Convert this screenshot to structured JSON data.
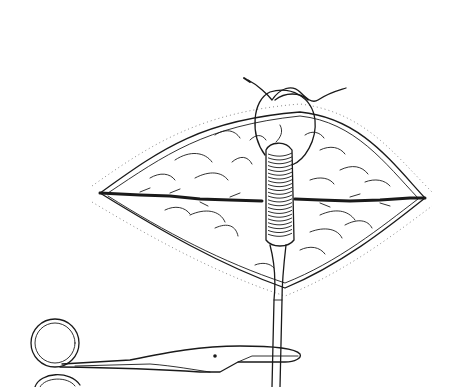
{
  "figure": {
    "kind": "surgical-line-illustration",
    "colors": {
      "ink": "#1a1a1a",
      "paper": "#ffffff",
      "stipple": "#555555"
    },
    "elements": [
      {
        "name": "wound-outline",
        "label": "Lens-shaped wound"
      },
      {
        "name": "incision-line",
        "label": "Incision"
      },
      {
        "name": "gauze-bolster",
        "label": "Rolled bolster"
      },
      {
        "name": "suture-loop",
        "label": "Suture loop and knot"
      },
      {
        "name": "forceps",
        "label": "Forceps"
      },
      {
        "name": "scissors",
        "label": "Scissors"
      }
    ],
    "bolster_coils": 22
  }
}
